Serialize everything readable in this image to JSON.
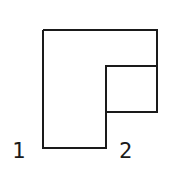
{
  "diagram": {
    "labels": [
      "1",
      "2"
    ],
    "stroke_color": "#1a1a1a",
    "background": "#ffffff"
  }
}
